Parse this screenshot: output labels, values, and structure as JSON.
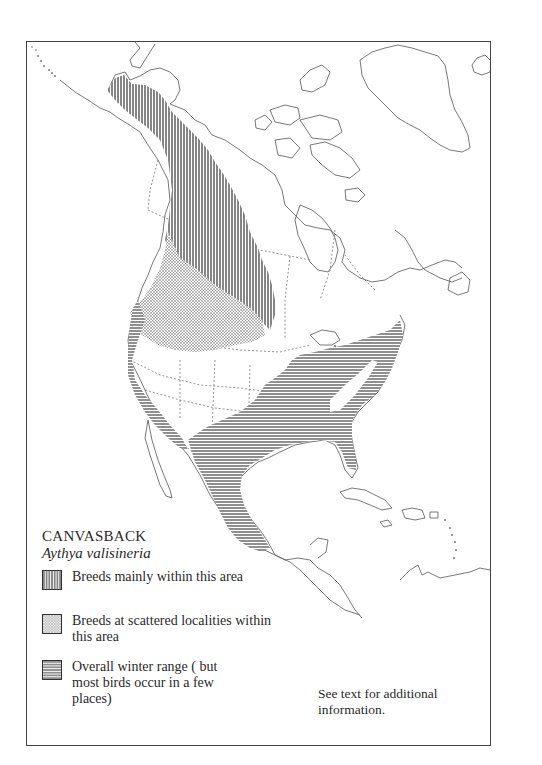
{
  "map": {
    "title": "CANVASBACK",
    "scientific_name": "Aythya valisineria",
    "region": "North America",
    "legend": [
      {
        "pattern": "vertical-hatch",
        "label": "Breeds mainly within this area"
      },
      {
        "pattern": "stipple",
        "label": "Breeds at scattered localities within this area"
      },
      {
        "pattern": "horizontal-hatch",
        "label": "Overall winter range ( but most birds occur in a few places)"
      }
    ],
    "note": "See text for additional information.",
    "colors": {
      "ink": "#2a2a2a",
      "outline": "#555555",
      "background": "#ffffff"
    }
  }
}
